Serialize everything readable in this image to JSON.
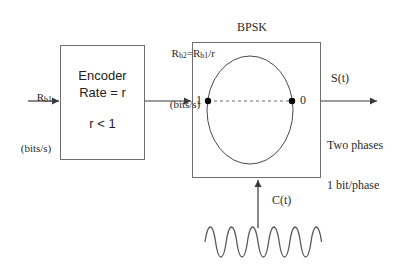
{
  "diagram": {
    "background": "#ffffff",
    "line_color": "#6f6f6f",
    "text_color": "#2b2b2b"
  },
  "labels": {
    "input_rate_line1": "Rb1",
    "input_rate_line1_main": "R",
    "input_rate_line1_sub": "b1",
    "input_rate_line2": "(bits/s)",
    "coded_rate_line1_a": "R",
    "coded_rate_line1_sub1": "b2",
    "coded_rate_line1_b": "=R",
    "coded_rate_line1_sub2": "b1",
    "coded_rate_line1_c": "/r",
    "coded_rate_line2": "(bits/s)",
    "bpsk_title": "BPSK",
    "output_signal": "S(t)",
    "output_note_line1": "Two phases",
    "output_note_line2": "1 bit/phase",
    "carrier_signal": "C(t)"
  },
  "encoder_block": {
    "line1": "Encoder",
    "line2": "Rate = r",
    "line3": "r < 1"
  },
  "constellation": {
    "point_left_label": "1",
    "point_right_label": "0",
    "point_color": "#000000",
    "dash_style": "dashed"
  },
  "carrier_wave": {
    "shape": "sine",
    "cycles": 10,
    "color": "#5a5a5a"
  }
}
